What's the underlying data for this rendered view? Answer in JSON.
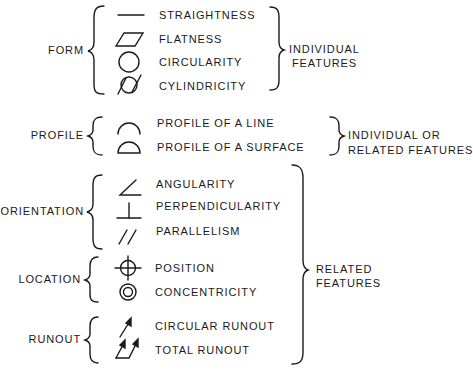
{
  "categories": [
    {
      "label": "FORM",
      "items": [
        {
          "symbol": "straightness-icon",
          "label": "STRAIGHTNESS"
        },
        {
          "symbol": "flatness-icon",
          "label": "FLATNESS"
        },
        {
          "symbol": "circularity-icon",
          "label": "CIRCULARITY"
        },
        {
          "symbol": "cylindricity-icon",
          "label": "CYLINDRICITY"
        }
      ]
    },
    {
      "label": "PROFILE",
      "items": [
        {
          "symbol": "profile-line-icon",
          "label": "PROFILE OF A LINE"
        },
        {
          "symbol": "profile-surface-icon",
          "label": "PROFILE OF A SURFACE"
        }
      ]
    },
    {
      "label": "ORIENTATION",
      "items": [
        {
          "symbol": "angularity-icon",
          "label": "ANGULARITY"
        },
        {
          "symbol": "perpendicularity-icon",
          "label": "PERPENDICULARITY"
        },
        {
          "symbol": "parallelism-icon",
          "label": "PARALLELISM"
        }
      ]
    },
    {
      "label": "LOCATION",
      "items": [
        {
          "symbol": "position-icon",
          "label": "POSITION"
        },
        {
          "symbol": "concentricity-icon",
          "label": "CONCENTRICITY"
        }
      ]
    },
    {
      "label": "RUNOUT",
      "items": [
        {
          "symbol": "circular-runout-icon",
          "label": "CIRCULAR RUNOUT"
        },
        {
          "symbol": "total-runout-icon",
          "label": "TOTAL RUNOUT"
        }
      ]
    }
  ],
  "groups": [
    {
      "line1": "INDIVIDUAL",
      "line2": "FEATURES"
    },
    {
      "line1": "INDIVIDUAL OR",
      "line2": "RELATED FEATURES"
    },
    {
      "line1": "RELATED",
      "line2": "FEATURES"
    }
  ]
}
